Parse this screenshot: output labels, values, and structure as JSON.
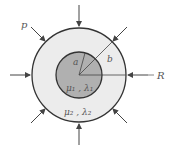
{
  "diagram": {
    "labels": {
      "pressure": "p",
      "outer_radius_label": "R",
      "inner_radius": "a",
      "outer_radius": "b",
      "inner_material": "μ₁ , λ₁",
      "outer_material": "μ₂ , λ₂"
    },
    "colors": {
      "inner_fill": "#b0b0b0",
      "outer_fill": "#ececec",
      "stroke": "#333333",
      "arrow": "#444444"
    },
    "geometry": {
      "center": [
        79,
        75
      ],
      "outer_radius_px": 47,
      "inner_radius_px": 23,
      "arrow_count": 8
    }
  }
}
